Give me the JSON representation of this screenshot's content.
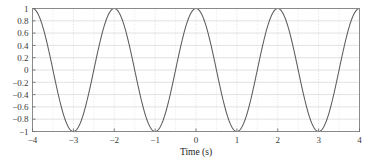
{
  "chart_data": {
    "type": "line",
    "title": "",
    "subtitle": "",
    "xlabel": "Time (s)",
    "ylabel": "",
    "xlim": [
      -4,
      4
    ],
    "ylim": [
      -1,
      1
    ],
    "grid": true,
    "legend": null,
    "legend_position": "none",
    "series": [
      {
        "name": "cosine",
        "color": "#5c5c5c",
        "expression": "cos(pi*t)",
        "amplitude": 1,
        "period": 2,
        "x": [
          -4,
          -3.75,
          -3.5,
          -3.25,
          -3,
          -2.75,
          -2.5,
          -2.25,
          -2,
          -1.75,
          -1.5,
          -1.25,
          -1,
          -0.75,
          -0.5,
          -0.25,
          0,
          0.25,
          0.5,
          0.75,
          1,
          1.25,
          1.5,
          1.75,
          2,
          2.25,
          2.5,
          2.75,
          3,
          3.25,
          3.5,
          3.75,
          4
        ],
        "values": [
          1,
          0.707,
          0,
          -0.707,
          -1,
          -0.707,
          0,
          0.707,
          1,
          0.707,
          0,
          -0.707,
          -1,
          -0.707,
          0,
          0.707,
          1,
          0.707,
          0,
          -0.707,
          -1,
          -0.707,
          0,
          0.707,
          1,
          0.707,
          0,
          -0.707,
          -1,
          -0.707,
          0,
          0.707,
          1
        ]
      }
    ],
    "x_ticks": [
      {
        "value": -4,
        "label": "-4"
      },
      {
        "value": -3,
        "label": "-3"
      },
      {
        "value": -2,
        "label": "-2"
      },
      {
        "value": -1,
        "label": "-1"
      },
      {
        "value": 0,
        "label": "0"
      },
      {
        "value": 1,
        "label": "1"
      },
      {
        "value": 2,
        "label": "2"
      },
      {
        "value": 3,
        "label": "3"
      },
      {
        "value": 4,
        "label": "4"
      }
    ],
    "x_minor_ticks": [
      -3.5,
      -2.5,
      -1.5,
      -0.5,
      0.5,
      1.5,
      2.5,
      3.5
    ],
    "y_ticks": [
      {
        "value": 1,
        "label": "1"
      },
      {
        "value": 0.8,
        "label": "0.8"
      },
      {
        "value": 0.6,
        "label": "0.6"
      },
      {
        "value": 0.4,
        "label": "0.4"
      },
      {
        "value": 0.2,
        "label": "0.2"
      },
      {
        "value": 0,
        "label": "0"
      },
      {
        "value": -0.2,
        "label": "-0.2"
      },
      {
        "value": -0.4,
        "label": "-0.4"
      },
      {
        "value": -0.6,
        "label": "-0.6"
      },
      {
        "value": -0.8,
        "label": "-0.8"
      },
      {
        "value": -1,
        "label": "-1"
      }
    ],
    "colors": {
      "curve": "#5c5c5c",
      "frame": "#8a8a8a",
      "grid_horizontal": "#cfcfcf",
      "grid_vertical": "#d0d0d0",
      "tick_label": "#3a3a3a",
      "background": "#ffffff"
    }
  }
}
